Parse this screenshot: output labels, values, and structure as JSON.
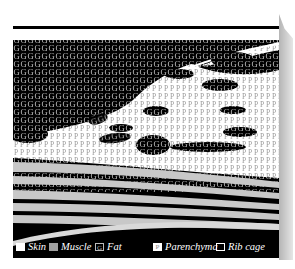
{
  "figure": {
    "type": "anatomical tissue layer diagram",
    "layers_top_to_bottom": [
      "Skin",
      "Fat",
      "Parenchyma",
      "Muscle",
      "Rib cage"
    ],
    "fat_fill_glyph": "G",
    "parenchyma_fill_glyph": "P"
  },
  "legend": {
    "items": [
      {
        "label": "Skin",
        "swatch": "white-solid",
        "color": "#ffffff"
      },
      {
        "label": "Muscle",
        "swatch": "gray-solid",
        "color": "#a0a0a0"
      },
      {
        "label": "Fat",
        "swatch": "letter-G",
        "glyph": "G",
        "color": "#000000"
      },
      {
        "label": "Parenchyma",
        "swatch": "letter-P",
        "glyph": "P",
        "color": "#ffffff"
      },
      {
        "label": "Rib cage",
        "swatch": "outline",
        "color": "#000000"
      }
    ]
  },
  "colors": {
    "background": "#000000",
    "skin": "#ffffff",
    "muscle": "#c8c8c8",
    "fat_glyph": "#bbbbbb",
    "parenchyma_glyph": "#9a9a9a",
    "shadow": "#c0c0c0"
  }
}
